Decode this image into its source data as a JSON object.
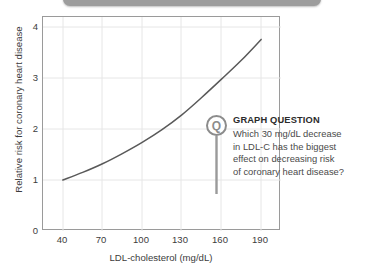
{
  "top_bar": {
    "name": "rounded-bar"
  },
  "chart_data": {
    "type": "line",
    "title": "",
    "xlabel": "LDL-cholesterol (mg/dL)",
    "ylabel": "Relative risk for coronary heart disease",
    "xlim": [
      25,
      205
    ],
    "ylim": [
      0,
      4.2
    ],
    "xticks": [
      40,
      70,
      100,
      130,
      160,
      190
    ],
    "yticks": [
      0,
      1,
      2,
      3,
      4
    ],
    "xtick_labels": [
      "40",
      "70",
      "100",
      "130",
      "160",
      "190"
    ],
    "ytick_labels": [
      "0",
      "1",
      "2",
      "3",
      "4"
    ],
    "grid": true,
    "legend": null,
    "series": [
      {
        "name": "Relative risk",
        "x": [
          40,
          55,
          70,
          85,
          100,
          115,
          130,
          145,
          160,
          175,
          190
        ],
        "y": [
          1.0,
          1.15,
          1.32,
          1.52,
          1.74,
          1.99,
          2.28,
          2.62,
          2.98,
          3.35,
          3.76
        ],
        "color": "#595959"
      }
    ]
  },
  "callout": {
    "icon_letter": "Q",
    "title": "GRAPH QUESTION",
    "lines": [
      "Which 30 mg/dL decrease",
      "in LDL-C has the biggest",
      "effect on decreasing risk",
      "of coronary heart disease?"
    ]
  },
  "colors": {
    "curve": "#595959",
    "axis": "#9a9a9a",
    "grid": "#e4e4e4",
    "text": "#3c3c3c",
    "callout_accent": "#8c8c8c",
    "bar": "#9d9d9d"
  }
}
